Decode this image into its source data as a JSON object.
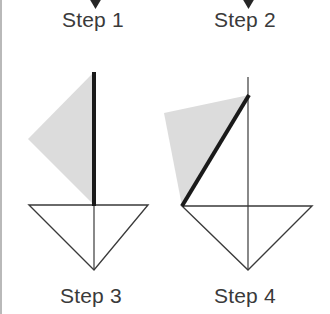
{
  "figure": {
    "width": 330,
    "height": 314,
    "background_color": "#ffffff",
    "border_color": "#b9b9b9",
    "stroke_color": "#3a3a3a",
    "thick_stroke_color": "#1a1a1a",
    "shade_fill_color": "#dcdcdc",
    "label_text_color": "#3a3a3a"
  },
  "labels": {
    "step_1": "Step 1",
    "step_2": "Step 2",
    "step_3": "Step 3",
    "step_4": "Step 4"
  },
  "icons": {
    "arrow_down_1": "arrow-down-icon",
    "arrow_down_2": "arrow-down-icon"
  },
  "arrows": [
    {
      "name": "arrow-down-step-1",
      "x": 95,
      "y": 0,
      "width": 13,
      "height": 9
    },
    {
      "name": "arrow-down-step-2",
      "x": 248,
      "y": 0,
      "width": 13,
      "height": 9
    }
  ],
  "left_diagram": {
    "name": "step-3-diagram",
    "triangle": {
      "left": [
        29,
        205
      ],
      "right": [
        148,
        205
      ],
      "apex": [
        94,
        270
      ]
    },
    "median_line": {
      "from": [
        94,
        205
      ],
      "to": [
        94,
        270
      ]
    },
    "thick_line": {
      "from": [
        94,
        72
      ],
      "to": [
        94,
        206
      ],
      "width": 4
    },
    "shaded_region": {
      "points": "94,72 28,139 94,205"
    }
  },
  "right_diagram": {
    "name": "step-4-diagram",
    "triangle": {
      "left": [
        182,
        206
      ],
      "right": [
        312,
        206
      ],
      "apex": [
        248,
        270
      ]
    },
    "vertical_line": {
      "from": [
        248,
        77
      ],
      "to": [
        248,
        270
      ]
    },
    "thick_line": {
      "from": [
        249,
        95
      ],
      "to": [
        182,
        206
      ],
      "width": 4
    },
    "shaded_region": {
      "points": "249,95 164,113 182,206"
    }
  }
}
